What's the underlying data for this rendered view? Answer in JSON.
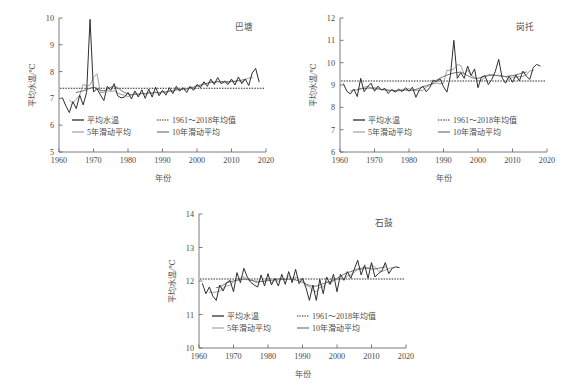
{
  "figure": {
    "background_color": "#ffffff",
    "line_colors": {
      "annual": "#2f2f2f",
      "ma5": "#9a9a9a",
      "ma10": "#6b6b6b",
      "mean": "#2b2b2b"
    }
  },
  "legend": {
    "annual_label": "平均水温",
    "mean_label": "1961～2018年均值",
    "ma5_label": "5年滑动平均",
    "ma10_label": "10年滑动平均"
  },
  "axis": {
    "xlabel": "年份",
    "ylabel": "平均水温/℃",
    "xticks": [
      "1960",
      "1970",
      "1980",
      "1990",
      "2000",
      "2010",
      "2020"
    ]
  },
  "chart_data": [
    {
      "type": "line",
      "title": "巴塘",
      "xlabel": "年份",
      "ylabel": "平均水温/℃",
      "xlim": [
        1960,
        2020
      ],
      "ylim": [
        5,
        10
      ],
      "yticks": [
        5,
        6,
        7,
        8,
        9,
        10
      ],
      "xticks": [
        1960,
        1970,
        1980,
        1990,
        2000,
        2010,
        2020
      ],
      "grid": false,
      "legend_position": "lower-center",
      "mean_value": 7.38,
      "x": [
        1961,
        1962,
        1963,
        1964,
        1965,
        1966,
        1967,
        1968,
        1969,
        1970,
        1971,
        1972,
        1973,
        1974,
        1975,
        1976,
        1977,
        1978,
        1979,
        1980,
        1981,
        1982,
        1983,
        1984,
        1985,
        1986,
        1987,
        1988,
        1989,
        1990,
        1991,
        1992,
        1993,
        1994,
        1995,
        1996,
        1997,
        1998,
        1999,
        2000,
        2001,
        2002,
        2003,
        2004,
        2005,
        2006,
        2007,
        2008,
        2009,
        2010,
        2011,
        2012,
        2013,
        2014,
        2015,
        2016,
        2017,
        2018
      ],
      "series": [
        {
          "name": "平均水温",
          "values": [
            7.02,
            6.72,
            6.47,
            6.88,
            6.62,
            7.12,
            6.76,
            7.22,
            9.95,
            7.24,
            7.36,
            7.13,
            6.92,
            7.45,
            7.3,
            7.55,
            7.1,
            7.02,
            7.05,
            7.22,
            6.98,
            7.28,
            7.05,
            7.32,
            7.0,
            7.35,
            7.05,
            7.42,
            7.1,
            7.3,
            7.12,
            7.4,
            7.18,
            7.45,
            7.28,
            7.4,
            7.22,
            7.45,
            7.3,
            7.52,
            7.4,
            7.62,
            7.45,
            7.72,
            7.52,
            7.78,
            7.55,
            7.62,
            7.52,
            7.72,
            7.5,
            7.8,
            7.55,
            7.72,
            7.48,
            7.95,
            8.12,
            7.62
          ]
        },
        {
          "name": "5年滑动平均",
          "values": [
            null,
            null,
            6.94,
            6.82,
            6.97,
            7.12,
            7.53,
            7.46,
            7.5,
            7.78,
            7.92,
            7.22,
            7.23,
            7.29,
            7.26,
            7.28,
            7.2,
            7.15,
            7.12,
            7.07,
            7.12,
            7.17,
            7.13,
            7.2,
            7.15,
            7.23,
            7.18,
            7.24,
            7.18,
            7.27,
            7.22,
            7.29,
            7.27,
            7.34,
            7.31,
            7.36,
            7.33,
            7.38,
            7.38,
            7.46,
            7.46,
            7.54,
            7.56,
            7.62,
            7.6,
            7.64,
            7.6,
            7.64,
            7.58,
            7.63,
            7.62,
            7.66,
            7.61,
            7.7,
            7.76,
            7.78,
            null,
            null
          ]
        },
        {
          "name": "10年滑动平均",
          "values": [
            null,
            null,
            null,
            null,
            7.22,
            7.25,
            7.28,
            7.33,
            7.38,
            7.42,
            7.38,
            7.3,
            7.28,
            7.34,
            7.42,
            7.44,
            7.4,
            7.3,
            7.22,
            7.17,
            7.14,
            7.16,
            7.16,
            7.18,
            7.18,
            7.2,
            7.2,
            7.22,
            7.21,
            7.24,
            7.24,
            7.27,
            7.28,
            7.32,
            7.32,
            7.35,
            7.36,
            7.4,
            7.42,
            7.47,
            7.5,
            7.54,
            7.56,
            7.6,
            7.6,
            7.62,
            7.62,
            7.64,
            7.62,
            7.64,
            7.64,
            7.67,
            7.68,
            7.72,
            null,
            null,
            null,
            null
          ]
        }
      ]
    },
    {
      "type": "line",
      "title": "岗托",
      "xlabel": "年份",
      "ylabel": "平均水温/℃",
      "xlim": [
        1960,
        2020
      ],
      "ylim": [
        6,
        12
      ],
      "yticks": [
        6,
        7,
        8,
        9,
        10,
        11,
        12
      ],
      "xticks": [
        1960,
        1970,
        1980,
        1990,
        2000,
        2010,
        2020
      ],
      "grid": false,
      "legend_position": "lower-center",
      "mean_value": 9.18,
      "x": [
        1961,
        1962,
        1963,
        1964,
        1965,
        1966,
        1967,
        1968,
        1969,
        1970,
        1971,
        1972,
        1973,
        1974,
        1975,
        1976,
        1977,
        1978,
        1979,
        1980,
        1981,
        1982,
        1983,
        1984,
        1985,
        1986,
        1987,
        1988,
        1989,
        1990,
        1991,
        1992,
        1993,
        1994,
        1995,
        1996,
        1997,
        1998,
        1999,
        2000,
        2001,
        2002,
        2003,
        2004,
        2005,
        2006,
        2007,
        2008,
        2009,
        2010,
        2011,
        2012,
        2013,
        2014,
        2015,
        2016,
        2017,
        2018
      ],
      "series": [
        {
          "name": "平均水温",
          "values": [
            9.05,
            8.72,
            8.6,
            8.82,
            8.48,
            9.3,
            8.7,
            8.92,
            9.08,
            8.72,
            8.95,
            8.78,
            8.85,
            8.62,
            8.8,
            8.68,
            8.82,
            8.7,
            8.88,
            8.72,
            8.9,
            8.45,
            8.78,
            8.95,
            8.7,
            8.88,
            9.22,
            9.15,
            9.28,
            8.92,
            8.68,
            9.42,
            11.0,
            9.3,
            9.55,
            9.3,
            9.85,
            9.42,
            9.72,
            8.88,
            9.35,
            9.42,
            9.02,
            9.25,
            9.6,
            10.15,
            9.32,
            9.08,
            9.4,
            9.12,
            9.45,
            9.18,
            9.62,
            9.4,
            9.25,
            9.78,
            9.92,
            9.85
          ]
        },
        {
          "name": "5年滑动平均",
          "values": [
            null,
            null,
            8.73,
            8.78,
            8.78,
            8.84,
            8.9,
            8.94,
            8.87,
            8.88,
            8.86,
            8.78,
            8.8,
            8.75,
            8.75,
            8.72,
            8.74,
            8.78,
            8.8,
            8.84,
            8.75,
            8.76,
            8.76,
            8.75,
            8.91,
            8.98,
            9.05,
            9.09,
            9.05,
            9.09,
            9.66,
            9.66,
            9.71,
            9.91,
            9.88,
            9.48,
            9.67,
            9.43,
            9.36,
            9.18,
            9.21,
            9.33,
            9.47,
            9.46,
            9.43,
            9.44,
            9.41,
            9.37,
            9.25,
            9.35,
            9.35,
            9.37,
            9.38,
            9.45,
            9.64,
            9.64,
            null,
            null
          ]
        },
        {
          "name": "10年滑动平均",
          "values": [
            null,
            null,
            null,
            null,
            8.8,
            8.83,
            8.84,
            8.86,
            8.86,
            8.83,
            8.82,
            8.8,
            8.78,
            8.77,
            8.76,
            8.75,
            8.76,
            8.77,
            8.77,
            8.76,
            8.77,
            8.8,
            8.86,
            8.92,
            8.97,
            9.02,
            9.07,
            9.22,
            9.3,
            9.38,
            9.44,
            9.5,
            9.54,
            9.56,
            9.58,
            9.51,
            9.42,
            9.34,
            9.3,
            9.3,
            9.34,
            9.4,
            9.42,
            9.44,
            9.43,
            9.41,
            9.39,
            9.38,
            9.4,
            9.42,
            9.45,
            9.5,
            9.55,
            9.58,
            null,
            null,
            null,
            null
          ]
        }
      ]
    },
    {
      "type": "line",
      "title": "石鼓",
      "xlabel": "年份",
      "ylabel": "平均水温/℃",
      "xlim": [
        1960,
        2020
      ],
      "ylim": [
        10,
        14
      ],
      "yticks": [
        10,
        11,
        12,
        13,
        14
      ],
      "xticks": [
        1960,
        1970,
        1980,
        1990,
        2000,
        2010,
        2020
      ],
      "grid": false,
      "legend_position": "lower-center",
      "mean_value": 12.06,
      "x": [
        1961,
        1962,
        1963,
        1964,
        1965,
        1966,
        1967,
        1968,
        1969,
        1970,
        1971,
        1972,
        1973,
        1974,
        1975,
        1976,
        1977,
        1978,
        1979,
        1980,
        1981,
        1982,
        1983,
        1984,
        1985,
        1986,
        1987,
        1988,
        1989,
        1990,
        1991,
        1992,
        1993,
        1994,
        1995,
        1996,
        1997,
        1998,
        1999,
        2000,
        2001,
        2002,
        2003,
        2004,
        2005,
        2006,
        2007,
        2008,
        2009,
        2010,
        2011,
        2012,
        2013,
        2014,
        2015,
        2016,
        2017,
        2018
      ],
      "values_note": "annual mean water temperature at Shigu station",
      "series": [
        {
          "name": "平均水温",
          "values": [
            11.92,
            11.62,
            11.82,
            11.55,
            11.42,
            11.88,
            11.7,
            11.95,
            12.02,
            11.68,
            12.25,
            11.95,
            12.38,
            12.12,
            11.96,
            11.88,
            11.82,
            12.18,
            11.85,
            12.22,
            11.88,
            12.08,
            11.85,
            12.2,
            11.9,
            12.28,
            11.95,
            12.35,
            11.92,
            12.08,
            11.8,
            11.42,
            11.88,
            11.42,
            12.05,
            11.62,
            12.12,
            11.9,
            12.2,
            11.68,
            12.2,
            12.02,
            12.28,
            12.08,
            12.35,
            12.62,
            12.18,
            12.48,
            12.08,
            12.55,
            12.12,
            12.22,
            12.3,
            12.55,
            12.22,
            12.38,
            12.42,
            12.4
          ]
        },
        {
          "name": "5年滑动平均",
          "values": [
            null,
            null,
            11.67,
            11.66,
            11.67,
            11.7,
            11.79,
            11.85,
            11.87,
            11.98,
            12.06,
            12.08,
            12.13,
            12.06,
            12.04,
            11.99,
            11.94,
            11.99,
            11.98,
            12.07,
            11.94,
            12.05,
            11.99,
            12.06,
            12.04,
            12.14,
            12.08,
            12.12,
            12.06,
            12.04,
            11.86,
            11.84,
            11.71,
            11.68,
            11.81,
            11.82,
            11.98,
            11.9,
            12.02,
            12.04,
            12.08,
            12.04,
            12.15,
            12.19,
            12.26,
            12.34,
            12.34,
            12.38,
            12.38,
            12.48,
            12.41,
            12.31,
            12.28,
            12.33,
            12.37,
            12.4,
            null,
            null
          ]
        },
        {
          "name": "10年滑动平均",
          "values": [
            null,
            null,
            null,
            null,
            11.8,
            11.82,
            11.88,
            11.94,
            11.98,
            12.0,
            12.02,
            12.04,
            12.06,
            12.04,
            12.02,
            12.0,
            11.99,
            11.99,
            12.0,
            12.01,
            12.02,
            12.04,
            12.06,
            12.05,
            12.05,
            12.06,
            12.05,
            12.03,
            12.0,
            11.96,
            11.91,
            11.87,
            11.84,
            11.85,
            11.88,
            11.92,
            11.96,
            11.98,
            12.02,
            12.08,
            12.14,
            12.2,
            12.25,
            12.28,
            12.32,
            12.36,
            12.38,
            12.4,
            12.38,
            12.36,
            12.36,
            12.38,
            12.4,
            12.42,
            null,
            null,
            null,
            null
          ]
        }
      ]
    }
  ]
}
